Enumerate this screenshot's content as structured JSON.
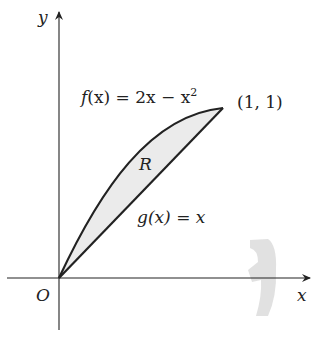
{
  "axes": {
    "x_label": "x",
    "y_label": "y",
    "origin_label": "O"
  },
  "curves": {
    "f_label_name": "f",
    "f_label_arg": "(x) = 2x − x",
    "f_label_exp": "2",
    "g_label": "g(x) = x"
  },
  "region": {
    "label": "R",
    "fill": "#ebebeb"
  },
  "point": {
    "label": "(1, 1)"
  },
  "decoration": {
    "icon": "rotation-arrow-icon",
    "color": "#d9d9d9"
  }
}
